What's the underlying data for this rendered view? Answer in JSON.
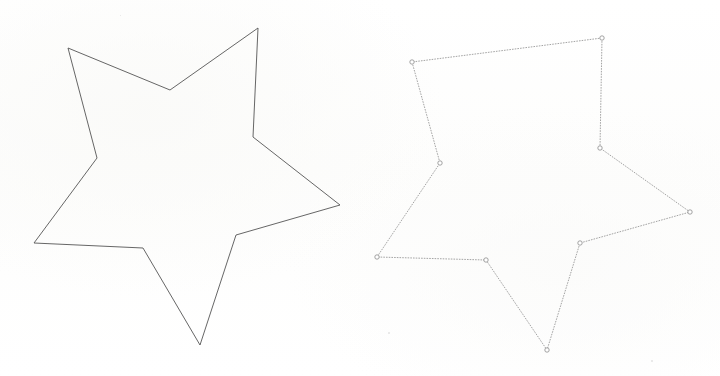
{
  "scene": {
    "title": "Two star polygon outlines",
    "width": 720,
    "height": 376,
    "background_color": "#fefefe"
  },
  "figures": [
    {
      "name": "original-star",
      "label": "Original star outline",
      "stroke_color": "#555555",
      "stroke_width": 0.9,
      "fill": "none",
      "markers": false,
      "marker_color": "",
      "points": [
        [
          258,
          28
        ],
        [
          170,
          90
        ],
        [
          68,
          48
        ],
        [
          97,
          158
        ],
        [
          34,
          243
        ],
        [
          143,
          248
        ],
        [
          200,
          345
        ],
        [
          236,
          235
        ],
        [
          340,
          205
        ],
        [
          253,
          137
        ]
      ]
    },
    {
      "name": "simplified-star",
      "label": "Simplified star outline with vertex markers",
      "stroke_color": "#9a9a9a",
      "stroke_width": 0.9,
      "fill": "none",
      "markers": true,
      "marker_color": "#8c8c8c",
      "marker_radius": 2.2,
      "points": [
        [
          602,
          38
        ],
        [
          412,
          62
        ],
        [
          440,
          163
        ],
        [
          377,
          257
        ],
        [
          486,
          260
        ],
        [
          547,
          350
        ],
        [
          580,
          243
        ],
        [
          690,
          212
        ],
        [
          600,
          148
        ]
      ]
    }
  ],
  "specks": [
    {
      "x": 388,
      "y": 332,
      "size": 2
    },
    {
      "x": 651,
      "y": 360,
      "size": 2
    },
    {
      "x": 120,
      "y": 15,
      "size": 1
    }
  ]
}
